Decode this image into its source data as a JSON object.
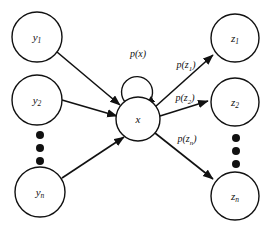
{
  "figure": {
    "type": "probabilistic-graph-diagram",
    "background_color": "#ffffff",
    "stroke_color": "#111111",
    "width": 277,
    "height": 231
  },
  "nodes": {
    "inputs": [
      {
        "id": "y1",
        "base": "y",
        "sub": "1",
        "cx": 37,
        "cy": 37,
        "r": 25
      },
      {
        "id": "y2",
        "base": "y",
        "sub": "2",
        "cx": 37,
        "cy": 100,
        "r": 25
      },
      {
        "id": "yn",
        "base": "y",
        "sub": "n",
        "cx": 40,
        "cy": 192,
        "r": 25
      }
    ],
    "center": {
      "id": "x",
      "base": "x",
      "sub": "",
      "cx": 138,
      "cy": 119,
      "r": 22
    },
    "outputs": [
      {
        "id": "z1",
        "base": "z",
        "sub": "1",
        "cx": 235,
        "cy": 38,
        "r": 24
      },
      {
        "id": "z2",
        "base": "z",
        "sub": "2",
        "cx": 235,
        "cy": 102,
        "r": 24
      },
      {
        "id": "zn",
        "base": "z",
        "sub": "n",
        "cx": 235,
        "cy": 196,
        "r": 24
      }
    ]
  },
  "ellipses": {
    "left": {
      "cx": 40,
      "cy_values": [
        135,
        148,
        161
      ],
      "r": 4
    },
    "right": {
      "cx": 236,
      "cy_values": [
        138,
        151,
        164
      ],
      "r": 4
    }
  },
  "edge_labels": {
    "self_loop": {
      "base": "p(x",
      "sub": "",
      "full": "p(x)",
      "x": 138,
      "y": 55
    },
    "z1": {
      "prefix": "p(z",
      "sub": "1",
      "suffix": ")",
      "x": 186,
      "y": 66
    },
    "z2": {
      "prefix": "p(z",
      "sub": "2",
      "suffix": ")",
      "x": 185,
      "y": 99
    },
    "zn": {
      "prefix": "p(z",
      "sub": "n",
      "suffix": ")",
      "x": 187,
      "y": 140
    }
  },
  "edges": [
    {
      "from": "y1",
      "to": "x",
      "directed": true
    },
    {
      "from": "y2",
      "to": "x",
      "directed": true
    },
    {
      "from": "yn",
      "to": "x",
      "directed": true
    },
    {
      "from": "x",
      "to": "x",
      "directed": true,
      "self_loop": true
    },
    {
      "from": "x",
      "to": "z1",
      "directed": true
    },
    {
      "from": "x",
      "to": "z2",
      "directed": true
    },
    {
      "from": "x",
      "to": "zn",
      "directed": true
    }
  ]
}
